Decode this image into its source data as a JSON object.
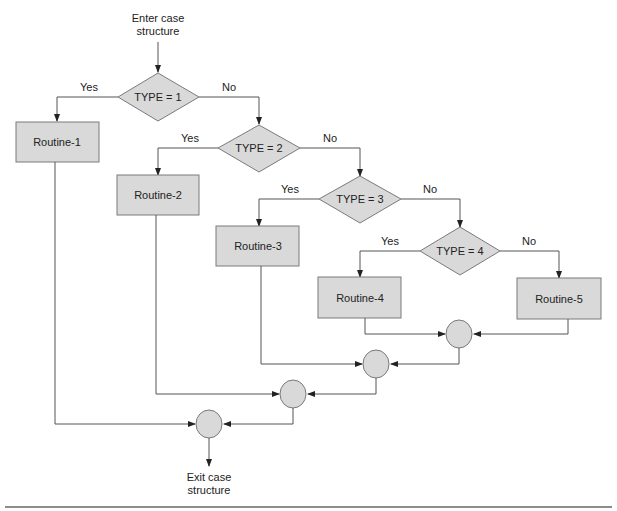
{
  "diagram": {
    "entry": {
      "line1": "Enter case",
      "line2": "structure"
    },
    "exit": {
      "line1": "Exit case",
      "line2": "structure"
    },
    "decisions": [
      {
        "label": "TYPE = 1",
        "yes": "Yes",
        "no": "No"
      },
      {
        "label": "TYPE = 2",
        "yes": "Yes",
        "no": "No"
      },
      {
        "label": "TYPE = 3",
        "yes": "Yes",
        "no": "No"
      },
      {
        "label": "TYPE = 4",
        "yes": "Yes",
        "no": "No"
      }
    ],
    "routines": [
      {
        "label": "Routine-1"
      },
      {
        "label": "Routine-2"
      },
      {
        "label": "Routine-3"
      },
      {
        "label": "Routine-4"
      },
      {
        "label": "Routine-5"
      }
    ],
    "connectors": 4,
    "colors": {
      "fill": "#d9d9d9",
      "stroke": "#7a7a7a",
      "line": "#555555"
    }
  }
}
